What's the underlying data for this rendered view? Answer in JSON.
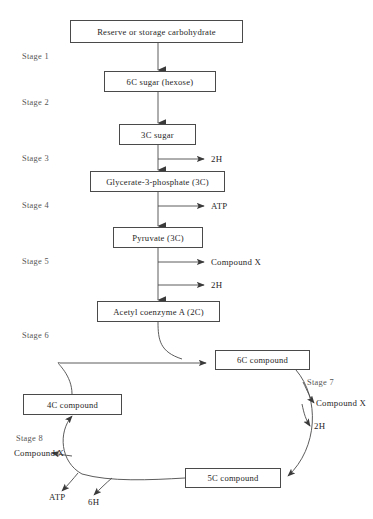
{
  "figure": {
    "title_fragment": "",
    "type": "biochemical-pathway-flowchart"
  },
  "nodes": {
    "reserve": "Reserve or storage carbohydrate",
    "hexose": "6C sugar (hexose)",
    "sugar3c": "3C sugar",
    "glycerate": "Glycerate-3-phosphate (3C)",
    "pyruvate": "Pyruvate (3C)",
    "acetyl": "Acetyl coenzyme A (2C)",
    "compound6c": "6C compound",
    "compound5c": "5C compound",
    "compound4c": "4C compound"
  },
  "stages": {
    "s1": "Stage 1",
    "s2": "Stage 2",
    "s3": "Stage 3",
    "s4": "Stage 4",
    "s5": "Stage 5",
    "s6": "Stage 6",
    "s7": "Stage 7",
    "s8": "Stage 8"
  },
  "products": {
    "stage3_2h": "2H",
    "stage4_atp": "ATP",
    "stage5_compound_x": "Compound X",
    "stage5_2h": "2H",
    "stage7_compound_x": "Compound X",
    "stage7_2h": "2H",
    "stage8_compound_x": "Compound X",
    "stage8_atp": "ATP",
    "stage8_6h": "6H"
  },
  "colors": {
    "line": "#4a4a4a",
    "box_border": "#4a4a4a",
    "text": "#262626",
    "stage_text": "#555555",
    "background": "#ffffff"
  }
}
